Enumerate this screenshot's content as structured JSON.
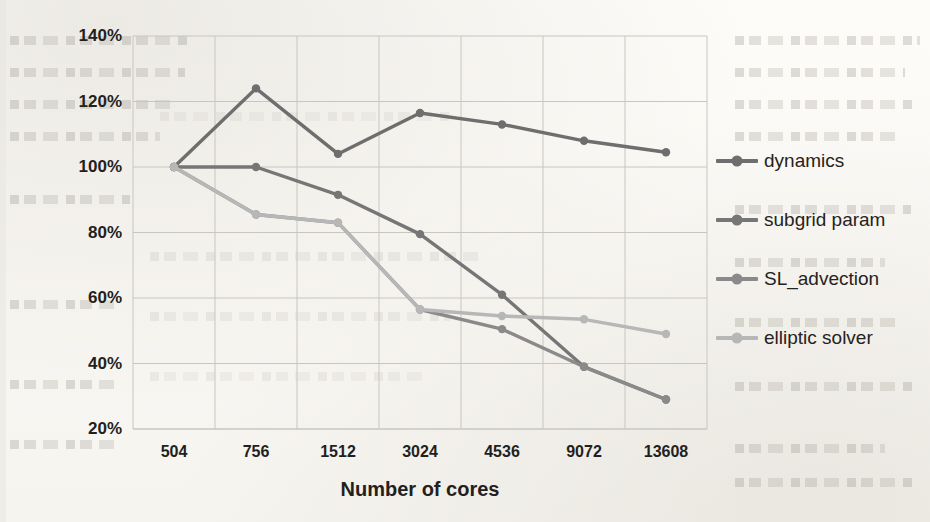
{
  "chart_data": {
    "type": "line",
    "title": "",
    "xlabel": "Number of cores",
    "ylabel": "Parallel efficiency",
    "categories": [
      "504",
      "756",
      "1512",
      "3024",
      "4536",
      "9072",
      "13608"
    ],
    "ytick_labels": [
      "140%",
      "120%",
      "100%",
      "80%",
      "60%",
      "40%",
      "20%"
    ],
    "ytick_values": [
      140,
      120,
      100,
      80,
      60,
      40,
      20
    ],
    "ylim": [
      20,
      140
    ],
    "yunit": "%",
    "grid": true,
    "legend_position": "right",
    "series": [
      {
        "name": "dynamics",
        "color": "#6e6e6e",
        "values": [
          100,
          124,
          104,
          116.5,
          113,
          108,
          104.5
        ]
      },
      {
        "name": "subgrid param",
        "color": "#767676",
        "values": [
          100,
          100,
          91.5,
          79.5,
          61,
          39,
          29
        ]
      },
      {
        "name": "SL_advection",
        "color": "#8a8a8a",
        "values": [
          100,
          85.5,
          83,
          56.5,
          50.5,
          39,
          29
        ]
      },
      {
        "name": "elliptic solver",
        "color": "#b7b7b7",
        "values": [
          100,
          85.5,
          83,
          56.5,
          54.5,
          53.5,
          49
        ]
      }
    ]
  },
  "legend": {
    "items": [
      {
        "label": "dynamics"
      },
      {
        "label": "subgrid param"
      },
      {
        "label": "SL_advection"
      },
      {
        "label": "elliptic solver"
      }
    ]
  }
}
